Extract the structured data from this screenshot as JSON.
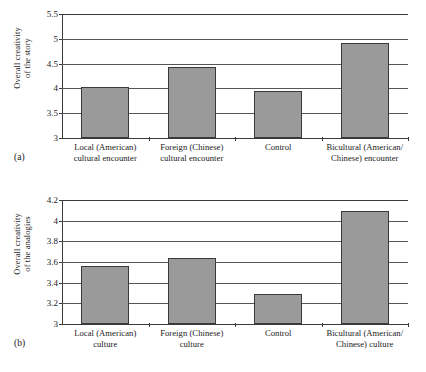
{
  "figure": {
    "background": "#ffffff",
    "bar_fill": "#9a9a9a",
    "bar_stroke": "#3a3a3a",
    "grid_color": "#555555"
  },
  "panels": [
    {
      "caption": "(a)",
      "ylabel_line1": "Overall creativity",
      "ylabel_line2": "of the story",
      "yticks": [
        "3",
        "3.5",
        "4",
        "4.5",
        "5",
        "5.5"
      ]
    },
    {
      "caption": "(b)",
      "ylabel_line1": "Overall creativity",
      "ylabel_line2": "of the analogies",
      "yticks": [
        "3",
        "3.2",
        "3.4",
        "3.6",
        "3.8",
        "4",
        "4.2"
      ]
    }
  ],
  "chart_data": [
    {
      "type": "bar",
      "panel": "(a)",
      "title": "",
      "xlabel": "",
      "ylabel": "Overall creativity of the story",
      "ylim": [
        3,
        5.5
      ],
      "yticks": [
        3,
        3.5,
        4,
        4.5,
        5,
        5.5
      ],
      "ytick_labels": [
        "3",
        "3.5",
        "4",
        "4.5",
        "5",
        "5.5"
      ],
      "grid": true,
      "legend": "none",
      "categories": [
        "Local (American) cultural encounter",
        "Foreign (Chinese) cultural encounter",
        "Control",
        "Bicultural (American/ Chinese) encounter"
      ],
      "category_lines": [
        [
          "Local (American)",
          "cultural encounter"
        ],
        [
          "Foreign (Chinese)",
          "cultural encounter"
        ],
        [
          "Control",
          ""
        ],
        [
          "Bicultural (American/",
          "Chinese) encounter"
        ]
      ],
      "values": [
        4.02,
        4.44,
        3.94,
        4.92
      ]
    },
    {
      "type": "bar",
      "panel": "(b)",
      "title": "",
      "xlabel": "",
      "ylabel": "Overall creativity of the analogies",
      "ylim": [
        3,
        4.2
      ],
      "yticks": [
        3,
        3.2,
        3.4,
        3.6,
        3.8,
        4,
        4.2
      ],
      "ytick_labels": [
        "3",
        "3.2",
        "3.4",
        "3.6",
        "3.8",
        "4",
        "4.2"
      ],
      "grid": true,
      "legend": "none",
      "categories": [
        "Local (American) culture",
        "Foreign (Chinese) culture",
        "Control",
        "Bicultural (American/ Chinese) culture"
      ],
      "category_lines": [
        [
          "Local (American)",
          "culture"
        ],
        [
          "Foreign (Chinese)",
          "culture"
        ],
        [
          "Control",
          ""
        ],
        [
          "Bicultural (American/",
          "Chinese) culture"
        ]
      ],
      "values": [
        3.56,
        3.64,
        3.29,
        4.09
      ]
    }
  ]
}
